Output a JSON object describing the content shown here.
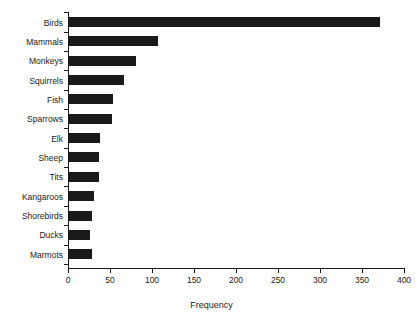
{
  "chart_data": {
    "type": "bar",
    "orientation": "horizontal",
    "title": "",
    "subtitle": "",
    "xlabel": "Frequency",
    "ylabel": "",
    "categories": [
      "Birds",
      "Mammals",
      "Monkeys",
      "Squirrels",
      "Fish",
      "Sparrows",
      "Elk",
      "Sheep",
      "Tits",
      "Kangaroos",
      "Shorebirds",
      "Ducks",
      "Marmots"
    ],
    "values": [
      372,
      107,
      81,
      67,
      54,
      52,
      38,
      37,
      37,
      31,
      29,
      26,
      29
    ],
    "series": [
      {
        "name": "Frequency",
        "values": [
          372,
          107,
          81,
          67,
          54,
          52,
          38,
          37,
          37,
          31,
          29,
          26,
          29
        ]
      }
    ],
    "xlim": [
      0,
      400
    ],
    "xticks": [
      0,
      50,
      100,
      150,
      200,
      250,
      300,
      350,
      400
    ],
    "xtick_labels": [
      "0",
      "50",
      "100",
      "150",
      "200",
      "250",
      "300",
      "350",
      "400"
    ],
    "grid": false,
    "legend": false,
    "legend_position": "none",
    "bar_color": "#1a1a1a",
    "background_color": "#ffffff",
    "axis_color": "#1a1a1a"
  }
}
